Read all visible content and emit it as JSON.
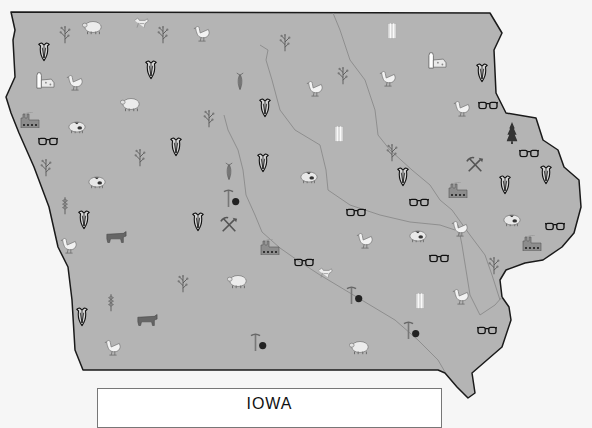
{
  "map": {
    "title": "IOWA",
    "colors": {
      "land": "#b4b4b4",
      "border": "#1a1a1a",
      "river": "#8a8a8a",
      "background": "#f6f6f6"
    },
    "outline": "11,12 490,13 502,33 494,50 496,93 506,113 536,118 543,140 558,150 564,167 579,180 581,207 574,233 562,247 543,260 525,263 506,270 500,280 502,297 509,307 511,320 502,347 487,360 472,373 475,393 468,398 457,387 445,373 438,370 83,370 75,350 72,300 68,267 58,247 49,207 34,167 19,133 11,113 6,97 15,77 13,40 15,30",
    "rivers": [
      "260,45 268,50 266,60 272,80 280,110 295,130 320,145 326,170 328,190 350,205 380,215 410,222 440,225 455,230",
      "333,13 340,30 350,60 365,80 375,110 378,135 390,150 412,170 430,185 440,200 452,210 470,235 485,255 492,275 500,300",
      "224,115 228,130 238,150 243,170 246,195 255,215 262,232 280,248 300,262 320,275 345,290 370,305 395,320 418,340 438,360 445,372",
      "458,225 462,245 466,270 470,295 480,315 495,305 502,297"
    ],
    "icons": [
      {
        "type": "corn",
        "x": 44,
        "y": 52
      },
      {
        "type": "plant",
        "x": 65,
        "y": 34
      },
      {
        "type": "sheep",
        "x": 93,
        "y": 27
      },
      {
        "type": "deer",
        "x": 141,
        "y": 22
      },
      {
        "type": "plant",
        "x": 163,
        "y": 34
      },
      {
        "type": "chicken",
        "x": 202,
        "y": 33
      },
      {
        "type": "plant",
        "x": 285,
        "y": 42
      },
      {
        "type": "silo",
        "x": 392,
        "y": 30
      },
      {
        "type": "corn",
        "x": 151,
        "y": 70
      },
      {
        "type": "dairy",
        "x": 45,
        "y": 80
      },
      {
        "type": "chicken",
        "x": 75,
        "y": 82
      },
      {
        "type": "cornstalk",
        "x": 240,
        "y": 82
      },
      {
        "type": "chicken",
        "x": 315,
        "y": 88
      },
      {
        "type": "plant",
        "x": 343,
        "y": 75
      },
      {
        "type": "chicken",
        "x": 388,
        "y": 78
      },
      {
        "type": "dairy",
        "x": 437,
        "y": 60
      },
      {
        "type": "corn",
        "x": 482,
        "y": 73
      },
      {
        "type": "sheep",
        "x": 131,
        "y": 104
      },
      {
        "type": "plant",
        "x": 209,
        "y": 118
      },
      {
        "type": "corn",
        "x": 265,
        "y": 108
      },
      {
        "type": "chicken",
        "x": 462,
        "y": 108
      },
      {
        "type": "glasses",
        "x": 488,
        "y": 105
      },
      {
        "type": "factory",
        "x": 30,
        "y": 120
      },
      {
        "type": "pig",
        "x": 77,
        "y": 127
      },
      {
        "type": "silo",
        "x": 339,
        "y": 133
      },
      {
        "type": "tree",
        "x": 512,
        "y": 133
      },
      {
        "type": "glasses",
        "x": 48,
        "y": 141
      },
      {
        "type": "corn",
        "x": 176,
        "y": 147
      },
      {
        "type": "plant",
        "x": 140,
        "y": 157
      },
      {
        "type": "plant",
        "x": 392,
        "y": 152
      },
      {
        "type": "glasses",
        "x": 529,
        "y": 153
      },
      {
        "type": "plant",
        "x": 46,
        "y": 167
      },
      {
        "type": "corn",
        "x": 263,
        "y": 163
      },
      {
        "type": "cornstalk",
        "x": 229,
        "y": 172
      },
      {
        "type": "pig",
        "x": 309,
        "y": 177
      },
      {
        "type": "pickshovel",
        "x": 475,
        "y": 165
      },
      {
        "type": "corn",
        "x": 403,
        "y": 177
      },
      {
        "type": "corn",
        "x": 546,
        "y": 175
      },
      {
        "type": "pig",
        "x": 97,
        "y": 182
      },
      {
        "type": "corn",
        "x": 505,
        "y": 185
      },
      {
        "type": "factory",
        "x": 458,
        "y": 190
      },
      {
        "type": "wheat",
        "x": 65,
        "y": 205
      },
      {
        "type": "pickcoal",
        "x": 233,
        "y": 198
      },
      {
        "type": "glasses",
        "x": 419,
        "y": 202
      },
      {
        "type": "corn",
        "x": 84,
        "y": 220
      },
      {
        "type": "corn",
        "x": 198,
        "y": 222
      },
      {
        "type": "pickshovel",
        "x": 229,
        "y": 225
      },
      {
        "type": "glasses",
        "x": 356,
        "y": 212
      },
      {
        "type": "pig",
        "x": 512,
        "y": 220
      },
      {
        "type": "glasses",
        "x": 555,
        "y": 226
      },
      {
        "type": "cow",
        "x": 116,
        "y": 237
      },
      {
        "type": "chicken",
        "x": 69,
        "y": 245
      },
      {
        "type": "factory",
        "x": 270,
        "y": 247
      },
      {
        "type": "chicken",
        "x": 365,
        "y": 240
      },
      {
        "type": "pig",
        "x": 418,
        "y": 236
      },
      {
        "type": "chicken",
        "x": 460,
        "y": 228
      },
      {
        "type": "factory",
        "x": 532,
        "y": 243
      },
      {
        "type": "glasses",
        "x": 304,
        "y": 262
      },
      {
        "type": "glasses",
        "x": 439,
        "y": 258
      },
      {
        "type": "deer",
        "x": 325,
        "y": 272
      },
      {
        "type": "plant",
        "x": 494,
        "y": 265
      },
      {
        "type": "plant",
        "x": 183,
        "y": 283
      },
      {
        "type": "sheep",
        "x": 238,
        "y": 281
      },
      {
        "type": "pickcoal",
        "x": 356,
        "y": 295
      },
      {
        "type": "silo",
        "x": 420,
        "y": 300
      },
      {
        "type": "chicken",
        "x": 461,
        "y": 296
      },
      {
        "type": "wheat",
        "x": 111,
        "y": 302
      },
      {
        "type": "corn",
        "x": 82,
        "y": 317
      },
      {
        "type": "cow",
        "x": 147,
        "y": 320
      },
      {
        "type": "pickcoal",
        "x": 413,
        "y": 330
      },
      {
        "type": "glasses",
        "x": 487,
        "y": 330
      },
      {
        "type": "chicken",
        "x": 113,
        "y": 347
      },
      {
        "type": "pickcoal",
        "x": 260,
        "y": 342
      },
      {
        "type": "sheep",
        "x": 360,
        "y": 347
      }
    ]
  }
}
